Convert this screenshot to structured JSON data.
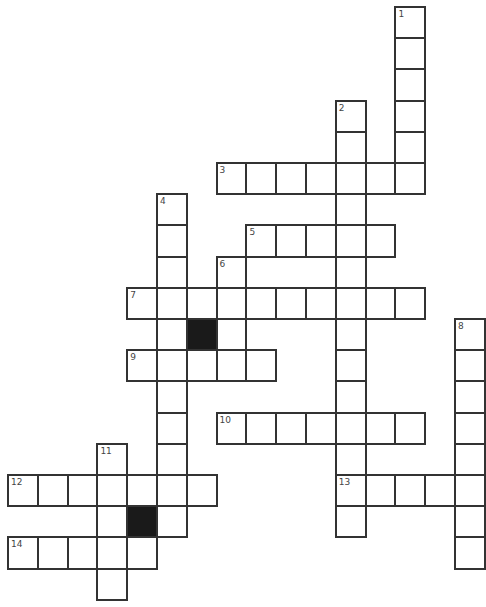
{
  "puzzle": {
    "type": "crossword",
    "origin": {
      "x": 8,
      "y": 7
    },
    "cell_pitch": {
      "x": 29.8,
      "y": 31.2
    },
    "colors": {
      "line": "#333333",
      "fill": "#ffffff",
      "block": "#1a1a1a",
      "number": "#444444"
    },
    "entries": [
      {
        "number": "1",
        "direction": "down",
        "row": 0,
        "col": 13,
        "length": 6
      },
      {
        "number": "2",
        "direction": "down",
        "row": 3,
        "col": 11,
        "length": 14
      },
      {
        "number": "3",
        "direction": "across",
        "row": 5,
        "col": 7,
        "length": 7
      },
      {
        "number": "4",
        "direction": "down",
        "row": 6,
        "col": 5,
        "length": 11
      },
      {
        "number": "5",
        "direction": "across",
        "row": 7,
        "col": 8,
        "length": 5
      },
      {
        "number": "6",
        "direction": "down",
        "row": 8,
        "col": 7,
        "length": 3
      },
      {
        "number": "7",
        "direction": "across",
        "row": 9,
        "col": 4,
        "length": 10
      },
      {
        "number": "8",
        "direction": "down",
        "row": 10,
        "col": 15,
        "length": 8
      },
      {
        "number": "9",
        "direction": "across",
        "row": 11,
        "col": 4,
        "length": 5
      },
      {
        "number": "10",
        "direction": "across",
        "row": 13,
        "col": 7,
        "length": 7
      },
      {
        "number": "11",
        "direction": "down",
        "row": 14,
        "col": 3,
        "length": 5
      },
      {
        "number": "12",
        "direction": "across",
        "row": 15,
        "col": 0,
        "length": 7
      },
      {
        "number": "13",
        "direction": "across",
        "row": 15,
        "col": 11,
        "length": 5
      },
      {
        "number": "14",
        "direction": "across",
        "row": 17,
        "col": 0,
        "length": 5
      }
    ],
    "black_cells": [
      {
        "row": 10,
        "col": 6
      },
      {
        "row": 16,
        "col": 4
      }
    ]
  }
}
